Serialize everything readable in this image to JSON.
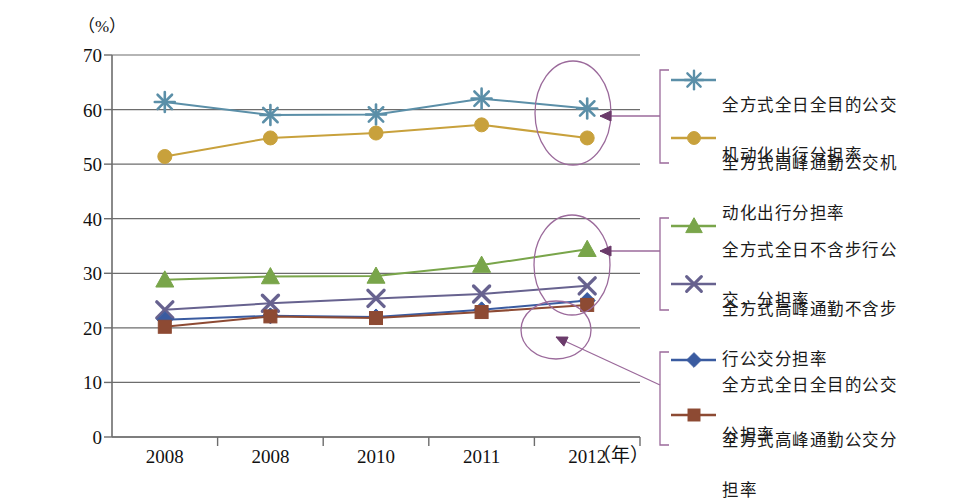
{
  "chart_data": {
    "type": "line",
    "title": "",
    "xlabel": "（年）",
    "ylabel": "（%）",
    "unit_label": "（%）",
    "year_label": "（年）",
    "categories": [
      "2008",
      "2008",
      "2010",
      "2011",
      "2012"
    ],
    "ylim": [
      0,
      70
    ],
    "yticks": [
      0,
      10,
      20,
      30,
      40,
      50,
      60,
      70
    ],
    "grid": true,
    "legend_position": "right",
    "series": [
      {
        "name": "全方式全日全目的公交机动化出行分担率",
        "label_line1": "全方式全日全目的公交",
        "label_line2": "机动化出行分担率",
        "marker": "star",
        "color": "#5b8fa8",
        "values": [
          61.4,
          59.0,
          59.1,
          62.0,
          60.2
        ]
      },
      {
        "name": "全方式高峰通勤公交机动化出行分担率",
        "label_line1": "全方式高峰通勤公交机",
        "label_line2": "动化出行分担率",
        "marker": "circle",
        "color": "#c8a13c",
        "values": [
          51.4,
          54.8,
          55.7,
          57.2,
          54.8
        ]
      },
      {
        "name": "全方式全日不含步行公交，分担率",
        "label_line1": "全方式全日不含步行公",
        "label_line2": "交，分担率",
        "marker": "triangle",
        "color": "#79a54a",
        "values": [
          28.8,
          29.4,
          29.5,
          31.5,
          34.4
        ]
      },
      {
        "name": "全方式高峰通勤不含步行公交分担率",
        "label_line1": "全方式高峰通勤不含步",
        "label_line2": "行公交分担率",
        "marker": "cross",
        "color": "#67628f",
        "values": [
          23.3,
          24.5,
          25.4,
          26.2,
          27.7
        ]
      },
      {
        "name": "全方式全日全目的公交分担率",
        "label_line1": "全方式全日全目的公交",
        "label_line2": "分担率",
        "marker": "diamond",
        "color": "#3a5ba0",
        "values": [
          21.5,
          22.2,
          22.0,
          23.3,
          25.0
        ]
      },
      {
        "name": "全方式高峰通勤公交分担率",
        "label_line1": "全方式高峰通勤公交分",
        "label_line2": "担率",
        "marker": "square",
        "color": "#8d4a33",
        "values": [
          20.2,
          22.1,
          21.8,
          22.9,
          24.2
        ]
      }
    ],
    "annotations": [
      {
        "name": "highlight-top",
        "shape": "ellipse",
        "target": "2012 top two series"
      },
      {
        "name": "highlight-middle",
        "shape": "ellipse",
        "target": "2012 green series"
      },
      {
        "name": "highlight-bottom",
        "shape": "ellipse",
        "target": "2012 bottom two series"
      }
    ],
    "annotation_color": "#9b6a9b"
  },
  "axis": {
    "y_ticks": [
      "70",
      "60",
      "50",
      "40",
      "30",
      "20",
      "10",
      "0"
    ],
    "unit": "（%）",
    "year": "（年）"
  }
}
